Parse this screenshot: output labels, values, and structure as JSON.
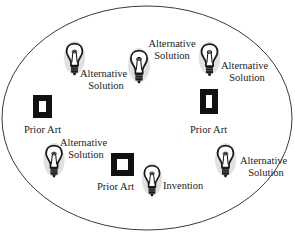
{
  "diagram": {
    "type": "concept-space",
    "boundary": {
      "shape": "ellipse",
      "cx": 147,
      "cy": 118,
      "rx": 145,
      "ry": 112,
      "stroke": "#3a3a3a"
    },
    "colors": {
      "ink": "#1a1a1a",
      "halo": "#bdbdbd",
      "square_fill": "#111111"
    },
    "bulbs": [
      {
        "id": "alt1",
        "x": 66,
        "y": 43,
        "w": 17,
        "h": 33,
        "label_line1": "Alternative",
        "label_line2": "Solution",
        "lx": 80,
        "ly": 68,
        "align": "left"
      },
      {
        "id": "alt2",
        "x": 130,
        "y": 50,
        "w": 18,
        "h": 34,
        "label_line1": "Alternative",
        "label_line2": "Solution",
        "lx": 146,
        "ly": 38,
        "align": "center"
      },
      {
        "id": "alt3",
        "x": 201,
        "y": 43,
        "w": 17,
        "h": 34,
        "label_line1": "Alternative",
        "label_line2": "Solution",
        "lx": 221,
        "ly": 60,
        "align": "left"
      },
      {
        "id": "alt4",
        "x": 45,
        "y": 145,
        "w": 18,
        "h": 33,
        "label_line1": "Alternative",
        "label_line2": "Solution",
        "lx": 60,
        "ly": 137,
        "align": "left"
      },
      {
        "id": "invention",
        "x": 144,
        "y": 165,
        "w": 16,
        "h": 32,
        "label_line1": "Invention",
        "label_line2": "",
        "lx": 163,
        "ly": 180,
        "align": "left"
      },
      {
        "id": "alt5",
        "x": 216,
        "y": 145,
        "w": 19,
        "h": 33,
        "label_line1": "Alternative",
        "label_line2": "Solution",
        "lx": 240,
        "ly": 155,
        "align": "left"
      }
    ],
    "prior_art": [
      {
        "id": "pa-left",
        "x": 33,
        "y": 95,
        "w": 19,
        "h": 23,
        "label": "Prior Art",
        "lx": 24,
        "ly": 124
      },
      {
        "id": "pa-right",
        "x": 200,
        "y": 89,
        "w": 18,
        "h": 25,
        "label": "Prior Art",
        "lx": 190,
        "ly": 124
      },
      {
        "id": "pa-center",
        "x": 111,
        "y": 153,
        "w": 23,
        "h": 23,
        "label": "Prior Art",
        "lx": 97,
        "ly": 181
      }
    ]
  }
}
